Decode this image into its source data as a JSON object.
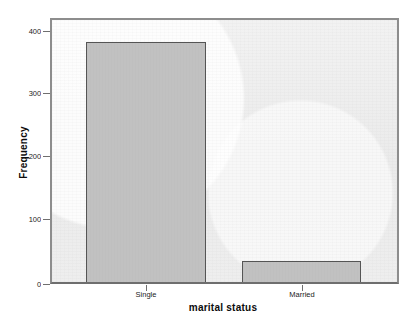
{
  "chart_data": {
    "type": "bar",
    "title": "",
    "subtitle": "",
    "xlabel": "marital status",
    "ylabel": "Frequency",
    "categories": [
      "Single",
      "Married"
    ],
    "values": [
      383,
      36
    ],
    "ylim": [
      0,
      420
    ],
    "yticks": [
      0,
      100,
      200,
      300,
      400
    ],
    "ytick_labels": [
      "0",
      "100",
      "200",
      "300",
      "400"
    ],
    "grid": false,
    "legend": false,
    "legend_position": "none",
    "bar_fill_color": "#c1c1c1",
    "bar_border_color": "#555555",
    "plot_background_color": "#ededed",
    "frame_border_color": "#8d8d8d",
    "axis_text_color": "#1b1b1b",
    "title_text_color": "#0c0c0c"
  },
  "axes": {
    "y_title": "Frequency",
    "x_title": "marital status"
  }
}
